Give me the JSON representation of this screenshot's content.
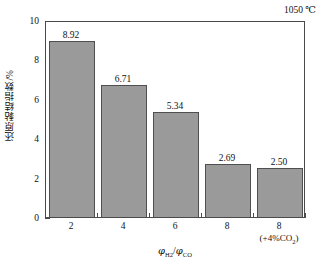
{
  "chart_data": {
    "type": "bar",
    "title": "",
    "subtitle": "",
    "categories": [
      "2",
      "4",
      "6",
      "8",
      "8"
    ],
    "category_sublabels": [
      "",
      "",
      "",
      "",
      "(+4%CO₂)"
    ],
    "values": [
      8.92,
      6.71,
      5.34,
      2.69,
      2.5
    ],
    "value_labels": [
      "8.92",
      "6.71",
      "5.34",
      "2.69",
      "2.50"
    ],
    "series": [
      {
        "name": "还原黏结指数",
        "values": [
          8.92,
          6.71,
          5.34,
          2.69,
          2.5
        ]
      }
    ],
    "xlabel": "φH₂/φCO",
    "ylabel": "还原黏结指数/%",
    "ylim": [
      0,
      10
    ],
    "yticks": [
      0,
      2,
      4,
      6,
      8,
      10
    ],
    "ytick_labels": [
      "0",
      "2",
      "4",
      "6",
      "8",
      "10"
    ],
    "grid": false,
    "legend": null,
    "legend_position": "none",
    "annotations": [
      "1050 ℃"
    ],
    "bar_color": "#9a9a9a",
    "bar_edge_color": "#4f4f4f",
    "axis_color": "#4a4a4a",
    "background_color": "#ffffff"
  },
  "axes": {
    "y_title": "还原黏结指数/%",
    "x_title_prefix": "φ",
    "x_title_sub1": "H",
    "x_title_sub1num": "2",
    "x_title_mid": "/",
    "x_title_prefix2": "φ",
    "x_title_sub2": "CO"
  },
  "annotation": {
    "temperature": "1050 ℃"
  },
  "xticks": {
    "labels": [
      "2",
      "4",
      "6",
      "8",
      "8"
    ],
    "sub_prefix": "(+4%CO",
    "sub_subscript": "2",
    "sub_suffix": ")"
  }
}
